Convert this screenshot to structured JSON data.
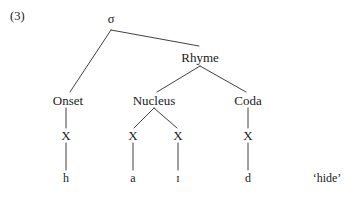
{
  "figure": {
    "example_number": "(3)",
    "gloss": "‘hide’",
    "background_color": "#ffffff",
    "ink_color": "#1a1a1a"
  },
  "tree": {
    "root": {
      "label": "σ",
      "name": "sigma"
    },
    "constituents": {
      "rhyme": "Rhyme",
      "onset": "Onset",
      "nucleus": "Nucleus",
      "coda": "Coda"
    },
    "skeleton_slots": [
      {
        "label": "X"
      },
      {
        "label": "X"
      },
      {
        "label": "X"
      },
      {
        "label": "X"
      }
    ],
    "segments": [
      {
        "label": "h"
      },
      {
        "label": "a"
      },
      {
        "label": "ɪ"
      },
      {
        "label": "d"
      }
    ]
  }
}
